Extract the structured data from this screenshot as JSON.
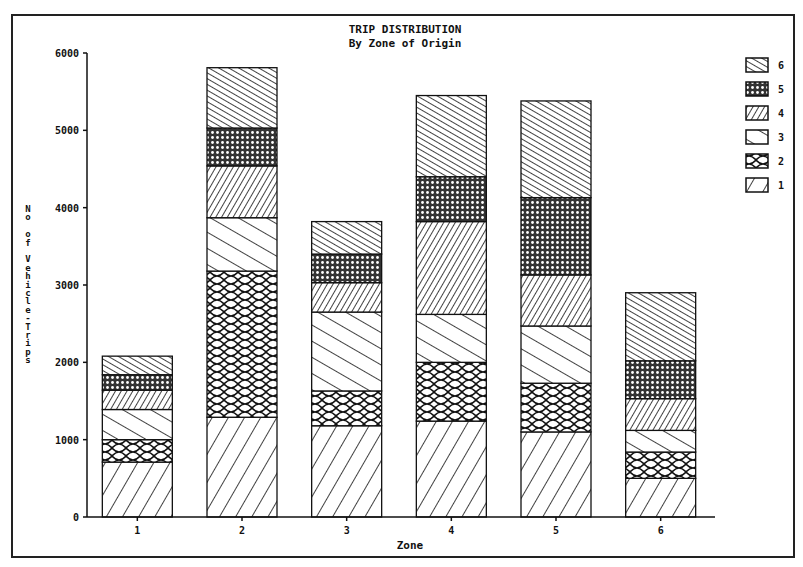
{
  "chart_data": {
    "type": "bar",
    "stacked": true,
    "title": "TRIP DISTRIBUTION",
    "subtitle": "By Zone of Origin",
    "xlabel": "Zone",
    "ylabel": "No of Vehicle-Trips",
    "ylim": [
      0,
      6000
    ],
    "yticks": [
      0,
      1000,
      2000,
      3000,
      4000,
      5000,
      6000
    ],
    "ytick_labels": [
      "0",
      "1000",
      "2000",
      "3000",
      "4000",
      "5000",
      "6000"
    ],
    "categories": [
      "1",
      "2",
      "3",
      "4",
      "5",
      "6"
    ],
    "legend_position": "right",
    "legend_order": [
      "6",
      "5",
      "4",
      "3",
      "2",
      "1"
    ],
    "grid": false,
    "series": [
      {
        "name": "1",
        "pattern": "wide-back-diagonal",
        "values": [
          710,
          1290,
          1180,
          1240,
          1100,
          500
        ]
      },
      {
        "name": "2",
        "pattern": "crosshatch",
        "values": [
          290,
          1890,
          450,
          760,
          630,
          340
        ]
      },
      {
        "name": "3",
        "pattern": "wide-forward-diagonal",
        "values": [
          390,
          690,
          1020,
          620,
          740,
          280
        ]
      },
      {
        "name": "4",
        "pattern": "dense-back-diagonal",
        "values": [
          250,
          670,
          380,
          1200,
          660,
          410
        ]
      },
      {
        "name": "5",
        "pattern": "dense-dots",
        "values": [
          200,
          490,
          370,
          580,
          1000,
          490
        ]
      },
      {
        "name": "6",
        "pattern": "dense-forward-diagonal",
        "values": [
          240,
          780,
          420,
          1050,
          1250,
          880
        ]
      }
    ],
    "totals": [
      2080,
      5810,
      3820,
      5450,
      5380,
      2900
    ]
  }
}
